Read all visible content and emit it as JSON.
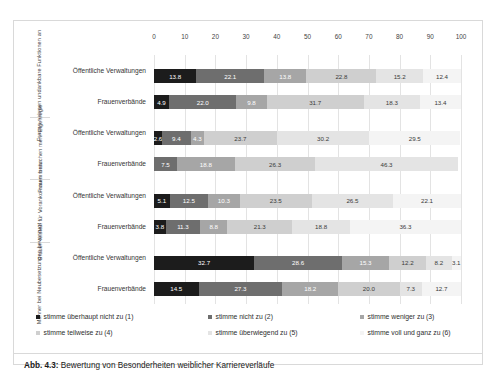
{
  "caption": {
    "number": "Abb. 4.3:",
    "text": " Bewertung von Besonderheiten weiblicher Karriereverläufe"
  },
  "legend": {
    "items": [
      {
        "key": "s1",
        "label": "stimme überhaupt nicht zu (1)",
        "color": "#1c1c1c"
      },
      {
        "key": "s2",
        "label": "stimme nicht zu (2)",
        "color": "#6e6e6e"
      },
      {
        "key": "s3",
        "label": "stimme weniger zu (3)",
        "color": "#a6a6a6"
      },
      {
        "key": "s4",
        "label": "stimme teilweise zu (4)",
        "color": "#cfcfcf"
      },
      {
        "key": "s5",
        "label": "stimme überwiegend zu (5)",
        "color": "#e4e4e4"
      },
      {
        "key": "s6",
        "label": "stimme voll und ganz zu (6)",
        "color": "#f4f4f4"
      }
    ]
  },
  "chart_data": {
    "type": "bar",
    "orientation": "horizontal",
    "stacked": true,
    "stack_mode": "percent",
    "title": "",
    "xlabel": "",
    "ylabel": "",
    "xlim": [
      0,
      100
    ],
    "xticks": [
      0,
      10,
      20,
      30,
      40,
      50,
      60,
      70,
      80,
      90,
      100
    ],
    "grid": true,
    "legend_position": "bottom",
    "series": [
      {
        "name": "stimme überhaupt nicht zu (1)",
        "color": "#1c1c1c"
      },
      {
        "name": "stimme nicht zu (2)",
        "color": "#6e6e6e"
      },
      {
        "name": "stimme weniger zu (3)",
        "color": "#a6a6a6"
      },
      {
        "name": "stimme teilweise zu (4)",
        "color": "#cfcfcf"
      },
      {
        "name": "stimme überwiegend zu (5)",
        "color": "#e4e4e4"
      },
      {
        "name": "stimme voll und ganz zu (6)",
        "color": "#f4f4f4"
      }
    ],
    "groups": [
      {
        "group_label": "Frauen nehmen undankbare Funktionen an",
        "rows": [
          {
            "category": "Öffentliche Verwaltungen",
            "values": [
              13.8,
              22.1,
              13.8,
              22.8,
              15.2,
              12.4
            ]
          },
          {
            "category": "Frauenverbände",
            "values": [
              4.9,
              22.0,
              9.8,
              31.7,
              18.3,
              13.4
            ]
          }
        ]
      },
      {
        "group_label": "Frauen brauchen mehr Eigenregie",
        "rows": [
          {
            "category": "Öffentliche Verwaltungen",
            "values": [
              2.6,
              9.4,
              4.3,
              23.7,
              30.2,
              29.5
            ]
          },
          {
            "category": "Frauenverbände",
            "values": [
              0.0,
              7.5,
              18.8,
              26.3,
              46.3,
              0.0
            ]
          }
        ]
      },
      {
        "group_label": "Frauen leisten für Vorankommen mehr",
        "rows": [
          {
            "category": "Öffentliche Verwaltungen",
            "values": [
              5.1,
              12.5,
              10.3,
              23.5,
              26.5,
              22.1
            ]
          },
          {
            "category": "Frauenverbände",
            "values": [
              3.8,
              11.3,
              8.8,
              21.3,
              18.8,
              36.3
            ]
          }
        ]
      },
      {
        "group_label": "Männer bei Neubesetzungen bevorzugt",
        "rows": [
          {
            "category": "Öffentliche Verwaltungen",
            "values": [
              32.7,
              28.6,
              15.3,
              12.2,
              8.2,
              3.1
            ]
          },
          {
            "category": "Frauenverbände",
            "values": [
              14.5,
              27.3,
              18.2,
              20.0,
              7.3,
              12.7
            ]
          }
        ]
      }
    ]
  }
}
